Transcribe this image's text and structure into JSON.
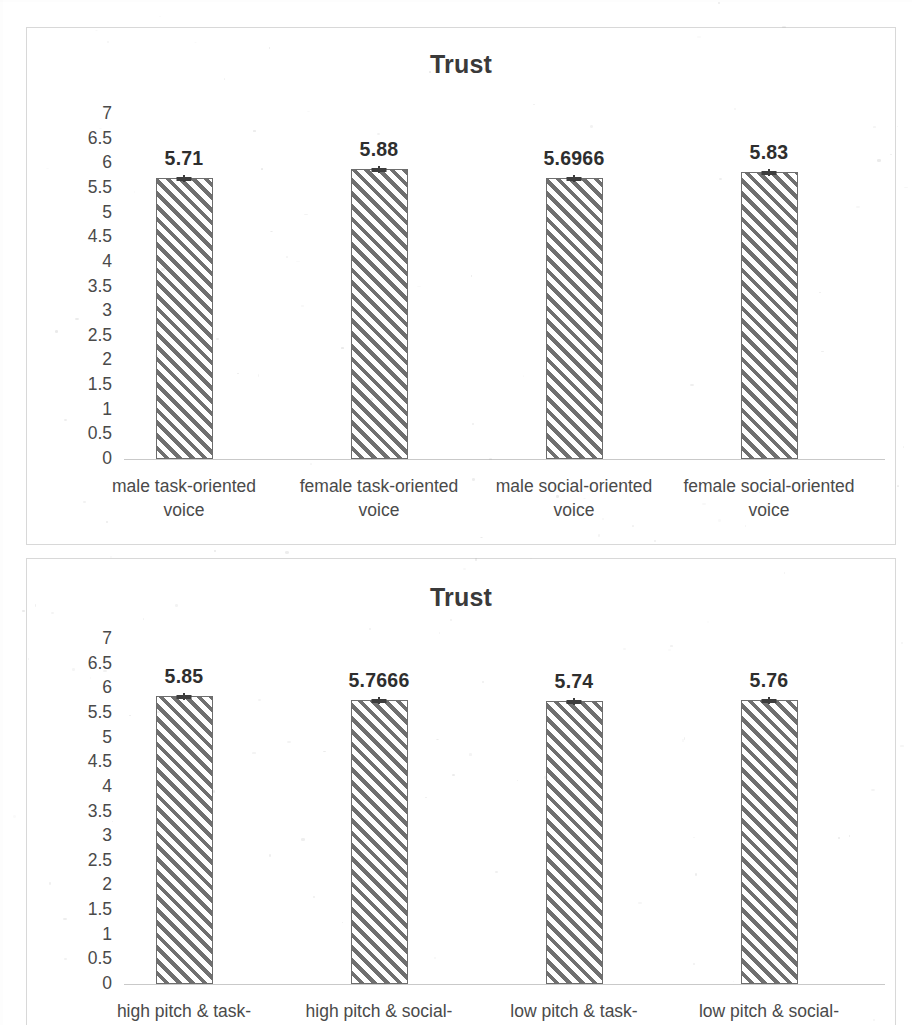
{
  "page": {
    "width": 912,
    "height": 1025,
    "background": "#ffffff",
    "ink_color": "#404040"
  },
  "charts": [
    {
      "id": "chart-top",
      "title": "Trust",
      "y_ticks": [
        "7",
        "6.5",
        "6",
        "5.5",
        "5",
        "4.5",
        "4",
        "3.5",
        "3",
        "2.5",
        "2",
        "1.5",
        "1",
        "0.5",
        "0"
      ],
      "bars": [
        {
          "value_label": "5.71",
          "value": 5.71,
          "line1": "male task-oriented",
          "line2": "voice"
        },
        {
          "value_label": "5.88",
          "value": 5.88,
          "line1": "female task-oriented",
          "line2": "voice"
        },
        {
          "value_label": "5.6966",
          "value": 5.6966,
          "line1": "male social-oriented",
          "line2": "voice"
        },
        {
          "value_label": "5.83",
          "value": 5.83,
          "line1": "female social-oriented",
          "line2": "voice"
        }
      ]
    },
    {
      "id": "chart-bottom",
      "title": "Trust",
      "y_ticks": [
        "7",
        "6.5",
        "6",
        "5.5",
        "5",
        "4.5",
        "4",
        "3.5",
        "3",
        "2.5",
        "2",
        "1.5",
        "1",
        "0.5",
        "0"
      ],
      "bars": [
        {
          "value_label": "5.85",
          "value": 5.85,
          "line1": "high pitch & task-",
          "line2": ""
        },
        {
          "value_label": "5.7666",
          "value": 5.7666,
          "line1": "high pitch & social-",
          "line2": ""
        },
        {
          "value_label": "5.74",
          "value": 5.74,
          "line1": "low pitch & task-",
          "line2": ""
        },
        {
          "value_label": "5.76",
          "value": 5.76,
          "line1": "low pitch & social-",
          "line2": ""
        }
      ]
    }
  ],
  "chart_data": [
    {
      "type": "bar",
      "title": "Trust",
      "xlabel": "",
      "ylabel": "",
      "ylim": [
        0,
        7
      ],
      "ytick_step": 0.5,
      "grid": false,
      "legend": "none",
      "error_bars": true,
      "categories": [
        "male task-oriented voice",
        "female task-oriented voice",
        "male social-oriented voice",
        "female social-oriented voice"
      ],
      "values": [
        5.71,
        5.88,
        5.6966,
        5.83
      ],
      "data_labels": [
        "5.71",
        "5.88",
        "5.6966",
        "5.83"
      ]
    },
    {
      "type": "bar",
      "title": "Trust",
      "xlabel": "",
      "ylabel": "",
      "ylim": [
        0,
        7
      ],
      "ytick_step": 0.5,
      "grid": false,
      "legend": "none",
      "error_bars": true,
      "categories": [
        "high pitch & task-",
        "high pitch & social-",
        "low pitch & task-",
        "low pitch & social-"
      ],
      "values": [
        5.85,
        5.7666,
        5.74,
        5.76
      ],
      "data_labels": [
        "5.85",
        "5.7666",
        "5.74",
        "5.76"
      ]
    }
  ]
}
